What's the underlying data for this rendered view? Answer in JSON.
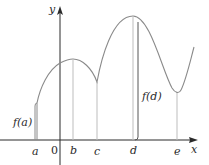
{
  "figure": {
    "type": "function-graph",
    "axes": {
      "x_label": "x",
      "y_label": "y",
      "origin_label": "0"
    },
    "points": {
      "a": "a",
      "b": "b",
      "c": "c",
      "d": "d",
      "e": "e"
    },
    "annotations": {
      "f_a": "f(a)",
      "f_d": "f(d)"
    },
    "colors": {
      "axis": "#2a2a2a",
      "curve": "#8a8a8a",
      "guide": "#bdbdbd",
      "highlight": "#555555"
    }
  }
}
